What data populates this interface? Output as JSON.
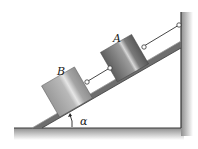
{
  "diagram": {
    "type": "physics-free-body-setup",
    "labels": {
      "block_a": "A",
      "block_b": "B",
      "angle": "α"
    },
    "elements": [
      "ground",
      "wall",
      "inclined-plank",
      "block-a",
      "block-b",
      "rope-wall-to-a",
      "rope-a-to-b",
      "angle-arrow"
    ],
    "colors": {
      "plank": "#6e6e6e",
      "block_a": "#7c7c7c",
      "block_b": "#a9a9a9",
      "rope": "#333333",
      "ground_shadow": "#9a9a9a"
    }
  }
}
